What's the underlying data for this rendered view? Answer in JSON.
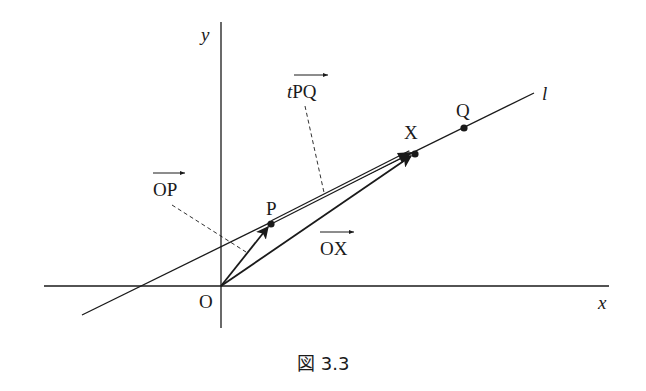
{
  "figure": {
    "caption": "図 3.3",
    "axes": {
      "x_label": "x",
      "y_label": "y",
      "origin_label": "O"
    },
    "line": {
      "label": "l"
    },
    "points": [
      {
        "id": "P",
        "label": "P"
      },
      {
        "id": "X",
        "label": "X"
      },
      {
        "id": "Q",
        "label": "Q"
      }
    ],
    "vectors": [
      {
        "id": "OP",
        "label": "OP",
        "prefix": ""
      },
      {
        "id": "OX",
        "label": "OX",
        "prefix": ""
      },
      {
        "id": "tPQ",
        "label": "PQ",
        "prefix": "t"
      }
    ],
    "colors": {
      "ink": "#1a1a1a",
      "background": "#ffffff"
    }
  }
}
